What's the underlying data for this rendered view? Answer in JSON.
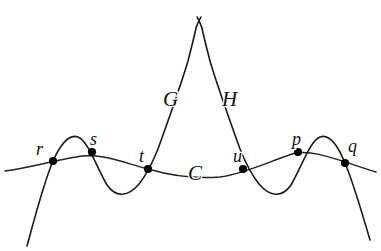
{
  "figure": {
    "type": "geometric-curve-diagram",
    "background_color": "#ffffff",
    "stroke_color": "#1a1a1a",
    "dot_color": "#050505",
    "width": 381,
    "height": 251
  },
  "curve_labels": [
    {
      "id": "G",
      "text": "G",
      "x": 163,
      "y": 106
    },
    {
      "id": "H",
      "text": "H",
      "x": 222,
      "y": 106
    },
    {
      "id": "C",
      "text": "C",
      "x": 188,
      "y": 180
    }
  ],
  "point_labels": [
    {
      "id": "r",
      "text": "r",
      "x": 36,
      "y": 155
    },
    {
      "id": "s",
      "text": "s",
      "x": 90,
      "y": 145
    },
    {
      "id": "t",
      "text": "t",
      "x": 139,
      "y": 162
    },
    {
      "id": "u",
      "text": "u",
      "x": 233,
      "y": 162
    },
    {
      "id": "p",
      "text": "p",
      "x": 292,
      "y": 145
    },
    {
      "id": "q",
      "text": "q",
      "x": 348,
      "y": 152
    }
  ],
  "intersection_points": [
    {
      "id": "r",
      "x": 53,
      "y": 161,
      "radius": 4.1,
      "on_curves": "C,G"
    },
    {
      "id": "s",
      "x": 92,
      "y": 152,
      "radius": 4.1,
      "on_curves": "C,G"
    },
    {
      "id": "t",
      "x": 148,
      "y": 169,
      "radius": 4.1,
      "on_curves": "C,G"
    },
    {
      "id": "u",
      "x": 243,
      "y": 169,
      "radius": 4.1,
      "on_curves": "C,H"
    },
    {
      "id": "p",
      "x": 298,
      "y": 152,
      "radius": 4.1,
      "on_curves": "C,H"
    },
    {
      "id": "q",
      "x": 345,
      "y": 163,
      "radius": 4.1,
      "on_curves": "C,H"
    }
  ],
  "paths": {
    "curve_c": "M 5 171 C 28 168 52 161 76 157 C 100 152 124 163 148 169 C 172 176 196 179 220 177 C 244 174 268 162 292 154 C 312 148 340 161 376 172",
    "curve_g": "M 27 246 C 36 213 44 182 53 161 C 62 141 70 134 78 137 C 88 141 96 166 107 185 C 116 198 128 197 139 184 C 147 174 152 164 158 149 C 168 121 180 88 188 61 C 191 49 194 38 196 28 C 198 22 200 19 201 17",
    "curve_h": "M 370 240 C 361 209 353 182 345 163 C 336 141 328 134 320 137 C 310 141 302 166 291 185 C 282 198 270 197 259 184 C 251 174 246 164 240 149 C 230 121 218 88 210 61 C 207 49 204 38 202 28 C 200 22 198 19 197 17"
  }
}
